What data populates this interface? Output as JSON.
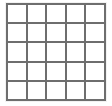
{
  "figure": {
    "name": "grid-diagram",
    "type": "grid",
    "rows": 5,
    "columns": 5,
    "cell_count": 25,
    "background_color": "#ffffff",
    "line_color": "#6e6e6e",
    "cell_fill_color": "#ffffff",
    "outer_border_width_px": 2,
    "inner_line_width_px": 2,
    "grid_origin_x_px": 6,
    "grid_origin_y_px": 3,
    "grid_width_px": 100,
    "grid_height_px": 98,
    "cell_width_px": 20,
    "cell_height_px": 20
  },
  "cells": [
    {
      "row": 1,
      "col": 1,
      "label": ""
    },
    {
      "row": 1,
      "col": 2,
      "label": ""
    },
    {
      "row": 1,
      "col": 3,
      "label": ""
    },
    {
      "row": 1,
      "col": 4,
      "label": ""
    },
    {
      "row": 1,
      "col": 5,
      "label": ""
    },
    {
      "row": 2,
      "col": 1,
      "label": ""
    },
    {
      "row": 2,
      "col": 2,
      "label": ""
    },
    {
      "row": 2,
      "col": 3,
      "label": ""
    },
    {
      "row": 2,
      "col": 4,
      "label": ""
    },
    {
      "row": 2,
      "col": 5,
      "label": ""
    },
    {
      "row": 3,
      "col": 1,
      "label": ""
    },
    {
      "row": 3,
      "col": 2,
      "label": ""
    },
    {
      "row": 3,
      "col": 3,
      "label": ""
    },
    {
      "row": 3,
      "col": 4,
      "label": ""
    },
    {
      "row": 3,
      "col": 5,
      "label": ""
    },
    {
      "row": 4,
      "col": 1,
      "label": ""
    },
    {
      "row": 4,
      "col": 2,
      "label": ""
    },
    {
      "row": 4,
      "col": 3,
      "label": ""
    },
    {
      "row": 4,
      "col": 4,
      "label": ""
    },
    {
      "row": 4,
      "col": 5,
      "label": ""
    },
    {
      "row": 5,
      "col": 1,
      "label": ""
    },
    {
      "row": 5,
      "col": 2,
      "label": ""
    },
    {
      "row": 5,
      "col": 3,
      "label": ""
    },
    {
      "row": 5,
      "col": 4,
      "label": ""
    },
    {
      "row": 5,
      "col": 5,
      "label": ""
    }
  ]
}
